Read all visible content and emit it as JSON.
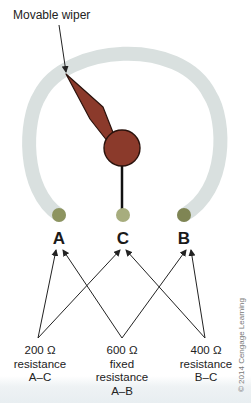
{
  "title_label": "Movable wiper",
  "terminals": [
    {
      "id": "A",
      "label": "A"
    },
    {
      "id": "C",
      "label": "C"
    },
    {
      "id": "B",
      "label": "B"
    }
  ],
  "captions": [
    {
      "line1": "200 Ω",
      "line2": "resistance",
      "line3": "A–C",
      "line4": ""
    },
    {
      "line1": "600 Ω",
      "line2": "fixed",
      "line3": "resistance",
      "line4": "A–B"
    },
    {
      "line1": "400 Ω",
      "line2": "resistance",
      "line3": "B–C",
      "line4": ""
    }
  ],
  "copyright": "© 2014 Cengage Learning",
  "colors": {
    "track": "#d9e0df",
    "wiper": "#8b3a2b",
    "wiper_stroke": "#2a120c",
    "terminal": "#8d9460",
    "text": "#222222"
  }
}
